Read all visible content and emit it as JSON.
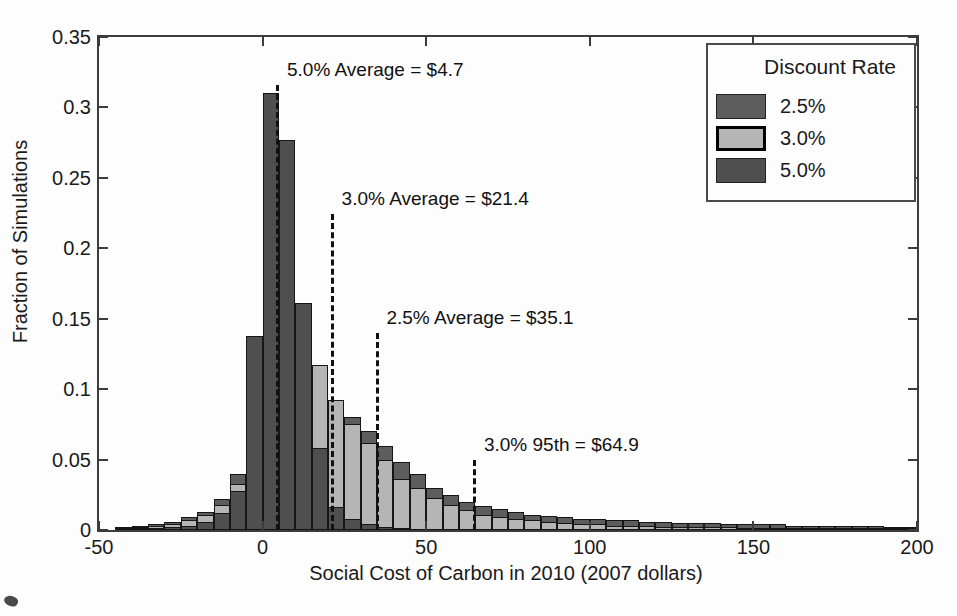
{
  "figure": {
    "y_axis": {
      "title": "Fraction of Simulations",
      "min": 0,
      "max": 0.35,
      "ticks": [
        {
          "v": 0,
          "label": "0"
        },
        {
          "v": 0.05,
          "label": "0.05"
        },
        {
          "v": 0.1,
          "label": "0.1"
        },
        {
          "v": 0.15,
          "label": "0.15"
        },
        {
          "v": 0.2,
          "label": "0.2"
        },
        {
          "v": 0.25,
          "label": "0.25"
        },
        {
          "v": 0.3,
          "label": "0.3"
        },
        {
          "v": 0.35,
          "label": "0.35"
        }
      ]
    },
    "x_axis": {
      "title": "Social Cost of Carbon in 2010 (2007 dollars)",
      "min": -50,
      "max": 200,
      "ticks": [
        {
          "v": -50,
          "label": "-50"
        },
        {
          "v": 0,
          "label": "0"
        },
        {
          "v": 50,
          "label": "50"
        },
        {
          "v": 100,
          "label": "100"
        },
        {
          "v": 150,
          "label": "150"
        },
        {
          "v": 200,
          "label": "200"
        }
      ]
    },
    "legend": {
      "title": "Discount Rate",
      "entries": [
        {
          "label": "2.5%",
          "color": "#5d5d5d",
          "border_color": "#222222",
          "border_width": 1
        },
        {
          "label": "3.0%",
          "color": "#b5b5b5",
          "border_color": "#000000",
          "border_width": 3
        },
        {
          "label": "5.0%",
          "color": "#4f4f4f",
          "border_color": "#222222",
          "border_width": 1
        }
      ]
    },
    "annotations": [
      {
        "text": "5.0% Average = $4.7",
        "x_value": 4.7,
        "line_top_value": 0.316
      },
      {
        "text": "3.0% Average = $21.4",
        "x_value": 21.4,
        "line_top_value": 0.224
      },
      {
        "text": "2.5% Average = $35.1",
        "x_value": 35.1,
        "line_top_value": 0.14
      },
      {
        "text": "3.0% 95th = $64.9",
        "x_value": 64.9,
        "line_top_value": 0.05
      }
    ]
  },
  "chart_data": {
    "type": "bar",
    "subtype": "overlaid-histogram",
    "title": "",
    "xlabel": "Social Cost of Carbon in 2010 (2007 dollars)",
    "ylabel": "Fraction of Simulations",
    "xlim": [
      -50,
      200
    ],
    "ylim": [
      0,
      0.35
    ],
    "grid": false,
    "legend_position": "upper-right",
    "bin_start": -45,
    "bin_width": 5,
    "bin_left_edges": [
      -45,
      -40,
      -35,
      -30,
      -25,
      -20,
      -15,
      -10,
      -5,
      0,
      5,
      10,
      15,
      20,
      25,
      30,
      35,
      40,
      45,
      50,
      55,
      60,
      65,
      70,
      75,
      80,
      85,
      90,
      95,
      100,
      105,
      110,
      115,
      120,
      125,
      130,
      135,
      140,
      145,
      150,
      155,
      160,
      165,
      170,
      175,
      180,
      185,
      190,
      195
    ],
    "draw_order": [
      "2.5%",
      "3.0%",
      "5.0%"
    ],
    "series": [
      {
        "name": "2.5%",
        "color": "#5d5d5d",
        "values": [
          0.002,
          0.003,
          0.004,
          0.006,
          0.009,
          0.013,
          0.022,
          0.04,
          0.052,
          0.066,
          0.084,
          0.092,
          0.088,
          0.09,
          0.08,
          0.07,
          0.06,
          0.048,
          0.04,
          0.03,
          0.025,
          0.02,
          0.017,
          0.015,
          0.013,
          0.011,
          0.01,
          0.009,
          0.008,
          0.008,
          0.007,
          0.007,
          0.006,
          0.006,
          0.005,
          0.005,
          0.005,
          0.004,
          0.004,
          0.004,
          0.004,
          0.003,
          0.003,
          0.003,
          0.003,
          0.003,
          0.003,
          0.002,
          0.002
        ]
      },
      {
        "name": "3.0%",
        "color": "#b5b5b5",
        "values": [
          0.001,
          0.002,
          0.003,
          0.004,
          0.007,
          0.011,
          0.018,
          0.033,
          0.064,
          0.082,
          0.145,
          0.148,
          0.117,
          0.092,
          0.075,
          0.062,
          0.05,
          0.036,
          0.03,
          0.023,
          0.018,
          0.014,
          0.011,
          0.009,
          0.008,
          0.007,
          0.006,
          0.005,
          0.004,
          0.004,
          0.003,
          0.003,
          0.003,
          0.002,
          0.002,
          0.002,
          0.002,
          0.002,
          0.001,
          0.001,
          0.001,
          0.001,
          0.001,
          0.001,
          0.001,
          0.001,
          0.001,
          0.001,
          0.001
        ]
      },
      {
        "name": "5.0%",
        "color": "#4f4f4f",
        "values": [
          0,
          0.001,
          0.001,
          0.002,
          0.003,
          0.006,
          0.012,
          0.028,
          0.138,
          0.31,
          0.277,
          0.161,
          0.058,
          0.016,
          0.008,
          0.004,
          0.002,
          0.001,
          0,
          0,
          0,
          0,
          0,
          0,
          0,
          0,
          0,
          0,
          0,
          0,
          0,
          0,
          0,
          0,
          0,
          0,
          0,
          0,
          0,
          0,
          0,
          0,
          0,
          0,
          0,
          0,
          0,
          0,
          0
        ]
      }
    ]
  }
}
